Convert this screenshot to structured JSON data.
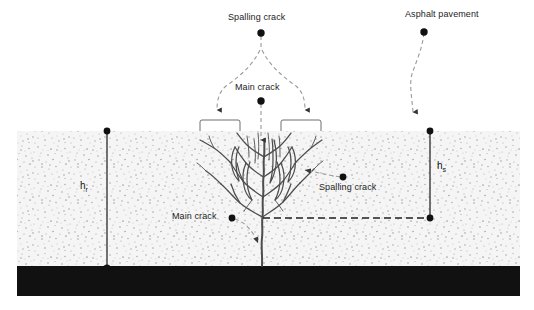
{
  "figure": {
    "type": "engineering-cross-section",
    "background_color": "#ffffff"
  },
  "labels": {
    "spalling_crack_top": "Spalling crack",
    "asphalt_pavement": "Asphalt pavement",
    "main_crack_top": "Main crack",
    "spalling_crack_right": "Spalling crack",
    "main_crack_left": "Main crack"
  },
  "dimensions": {
    "h_r": {
      "symbol": "h",
      "subscript": "r"
    },
    "h_s": {
      "symbol": "h",
      "subscript": "s"
    }
  },
  "layers": [
    {
      "name": "overlay-speckled-layer",
      "fill": "#f2f2f2",
      "top": 131,
      "bottom": 266
    },
    {
      "name": "asphalt-pavement-layer",
      "fill": "#111111",
      "top": 266,
      "bottom": 296
    }
  ],
  "colors": {
    "speckle_base": "#f4f4f4",
    "speckle_dot": "#9a9a9a",
    "asphalt_black": "#111111",
    "crack_stroke": "#4a4a4a",
    "leader_dash": "#8a8a8a",
    "marker_dot": "#111111",
    "bracket_stroke": "#6f6f6f",
    "dim_line": "#2a2a2a"
  },
  "annotations": {
    "brackets": [
      {
        "name": "left-spalling-zone-bracket",
        "x1": 200,
        "x2": 240
      },
      {
        "name": "right-spalling-zone-bracket",
        "x1": 281,
        "x2": 321
      }
    ],
    "dashed_depth_line": {
      "name": "crack-depth-reference-line",
      "from_x": 263,
      "to_x": 430,
      "y": 218
    },
    "dimension_lines": [
      {
        "name": "h-r-dimension-line",
        "x": 107,
        "y1": 131,
        "y2": 268
      },
      {
        "name": "h-s-dimension-line",
        "x": 430,
        "y1": 131,
        "y2": 218
      }
    ]
  }
}
